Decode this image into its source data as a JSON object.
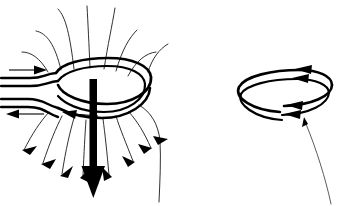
{
  "figure": {
    "title": "Magnetic field of a current-carrying loop and a bare two-turn loop",
    "background_color": "#ffffff",
    "ink_color": "#000000",
    "fieldline_color": "#1a1a1a",
    "width_px": 341,
    "height_px": 206
  },
  "panels": [
    {
      "id": "left-panel",
      "name": "current-loop-with-field",
      "center_x": 88,
      "center_y": 95,
      "coil": {
        "name": "two-turn-coil-angled-view",
        "turns": 2,
        "center_x": 92,
        "center_y": 95,
        "radius_x": 57,
        "radius_y": 22,
        "tilt": "viewed from slightly above, front edge nearer viewer"
      },
      "lead_wires": {
        "name": "lead-wires-entering-from-left",
        "count": 4,
        "entry_x": 2,
        "y_values": [
          72,
          81,
          101,
          110
        ]
      },
      "current_arrows": [
        {
          "name": "current-arrow-in-top-lead",
          "direction": "right",
          "x": 10,
          "y": 70,
          "length": 34
        },
        {
          "name": "current-arrow-in-bottom-lead",
          "direction": "left",
          "x": 8,
          "y": 113,
          "length": 34
        },
        {
          "name": "current-arrow-on-front-of-coil",
          "direction": "left",
          "x": 78,
          "y": 118,
          "length": 22
        }
      ],
      "moment_vector": {
        "name": "magnetic-moment-arrow",
        "direction": "down",
        "tail_x": 93,
        "tail_y": 79,
        "head_x": 93,
        "head_y": 196,
        "shaft_width": 7,
        "head_width": 23,
        "head_length": 26
      },
      "field_lines": {
        "name": "magnetic-field-lines",
        "count_above": 7,
        "count_below": 7,
        "arrowhead_count": 8,
        "arrow_direction": "outward and downward away from the loop"
      }
    },
    {
      "id": "right-panel",
      "name": "bare-two-turn-current-loop",
      "coil": {
        "name": "two-turn-loop",
        "turns": 2,
        "center_x": 284,
        "center_y": 92,
        "radius_x": 48,
        "radius_y": 20
      },
      "current_arrows": [
        {
          "name": "current-arrowhead-top-outer",
          "direction": "left",
          "x": 297,
          "y": 70
        },
        {
          "name": "current-arrowhead-top-inner",
          "direction": "left",
          "x": 294,
          "y": 79
        },
        {
          "name": "current-arrowhead-bottom-outer",
          "direction": "left",
          "x": 292,
          "y": 106
        },
        {
          "name": "current-arrowhead-bottom-inner",
          "direction": "left",
          "x": 290,
          "y": 115
        }
      ],
      "pointer": {
        "name": "leader-line-pointing-to-loop",
        "from_x": 331,
        "from_y": 203,
        "to_x": 304,
        "to_y": 118,
        "arrow_direction": "up-left toward the loop"
      }
    }
  ],
  "legend": {
    "visible": false,
    "labels": []
  }
}
